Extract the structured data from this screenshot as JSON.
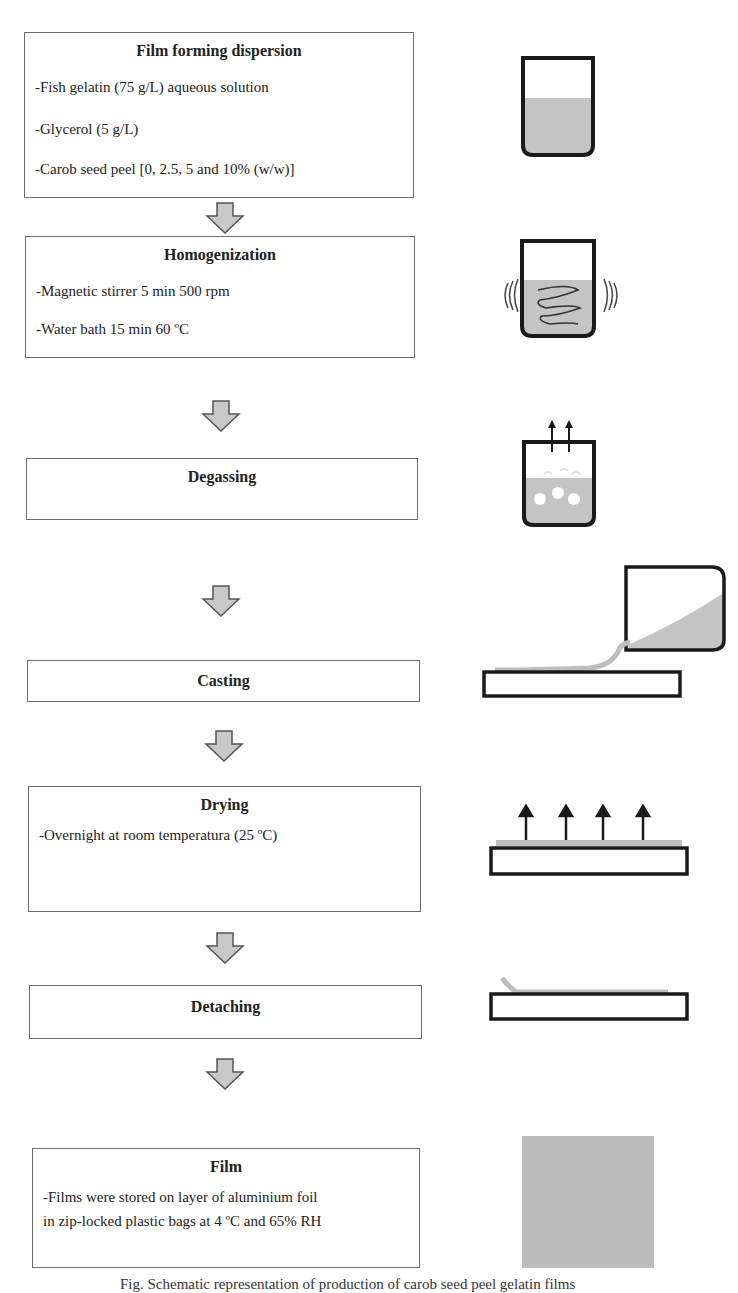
{
  "diagram": {
    "type": "process-flowchart",
    "steps": [
      {
        "title": "Film forming dispersion",
        "lines": [
          "-Fish gelatin (75 g/L) aqueous solution",
          "-Glycerol (5 g/L)",
          "-Carob seed peel [0, 2.5, 5 and 10% (w/w)]"
        ],
        "illustration": "beaker-with-solution-icon"
      },
      {
        "title": "Homogenization",
        "lines": [
          "-Magnetic stirrer 5 min 500 rpm",
          "-Water bath 15 min 60 ºC"
        ],
        "illustration": "beaker-stirring-vibrating-icon"
      },
      {
        "title": "Degassing",
        "lines": [],
        "illustration": "beaker-bubbles-escaping-icon"
      },
      {
        "title": "Casting",
        "lines": [],
        "illustration": "pouring-solution-onto-plate-icon"
      },
      {
        "title": "Drying",
        "lines": [
          "-Overnight at room temperatura (25 ºC)"
        ],
        "illustration": "plate-evaporation-arrows-icon"
      },
      {
        "title": "Detaching",
        "lines": [],
        "illustration": "peeling-film-from-plate-icon"
      },
      {
        "title": "Film",
        "lines": [
          "-Films were stored on layer of aluminium foil",
          "in zip-locked plastic bags at 4 ºC and 65% RH"
        ],
        "illustration": "film-sample-square-icon"
      }
    ],
    "connector": "down-arrow-icon",
    "colors": {
      "box_border": "#6e6e6e",
      "arrow_fill": "#c8c8c8",
      "arrow_stroke": "#555555",
      "liquid_fill": "#c4c4c4",
      "outline": "#1a1a1a"
    }
  },
  "caption": "Fig. Schematic representation of production of carob seed peel gelatin films"
}
